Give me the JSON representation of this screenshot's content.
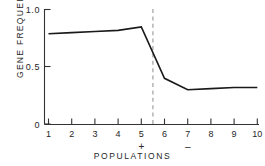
{
  "chart_data": {
    "type": "line",
    "title": "",
    "subtitle": "",
    "xlabel": "POPULATIONS",
    "ylabel": "GENE FREQUENCY",
    "x": [
      1,
      2,
      3,
      4,
      5,
      6,
      7,
      8,
      9,
      10
    ],
    "values": [
      0.79,
      0.8,
      0.81,
      0.82,
      0.85,
      0.4,
      0.3,
      0.31,
      0.32,
      0.32
    ],
    "series": [
      {
        "name": "gene frequency",
        "values": [
          0.79,
          0.8,
          0.81,
          0.82,
          0.85,
          0.4,
          0.3,
          0.31,
          0.32,
          0.32
        ]
      }
    ],
    "xlim": [
      1,
      10
    ],
    "ylim": [
      0,
      1.0
    ],
    "ytick_labels": [
      "0",
      "0.5",
      "1.0"
    ],
    "ytick_values": [
      0,
      0.5,
      1.0
    ],
    "xtick_labels": [
      "1",
      "2",
      "3",
      "4",
      "5",
      "6",
      "7",
      "8",
      "9",
      "10"
    ],
    "xtick_values": [
      1,
      2,
      3,
      4,
      5,
      6,
      7,
      8,
      9,
      10
    ],
    "grid": false,
    "legend": false,
    "legend_position": "none",
    "line_color": "#1a1a1a",
    "axis_color": "#333333",
    "divider_color": "#a8a8a8",
    "annotations": [
      {
        "name": "group-plus",
        "label": "+",
        "x": 5,
        "note": "group marker below x tick 5"
      },
      {
        "name": "group-minus",
        "label": "–",
        "x": 7,
        "note": "group marker below x tick 7"
      },
      {
        "name": "divider",
        "label": "",
        "x": 5.5,
        "note": "vertical dashed line separating + and - populations"
      }
    ]
  },
  "axis": {
    "y_top_label": "1.0",
    "y_mid_label": "0.5",
    "y_bottom_label": "0",
    "x_labels": [
      "1",
      "2",
      "3",
      "4",
      "5",
      "6",
      "7",
      "8",
      "9",
      "10"
    ],
    "y_title": "GENE FREQUENCY",
    "x_title": "POPULATIONS"
  },
  "markers": {
    "plus": "+",
    "minus": "–"
  }
}
